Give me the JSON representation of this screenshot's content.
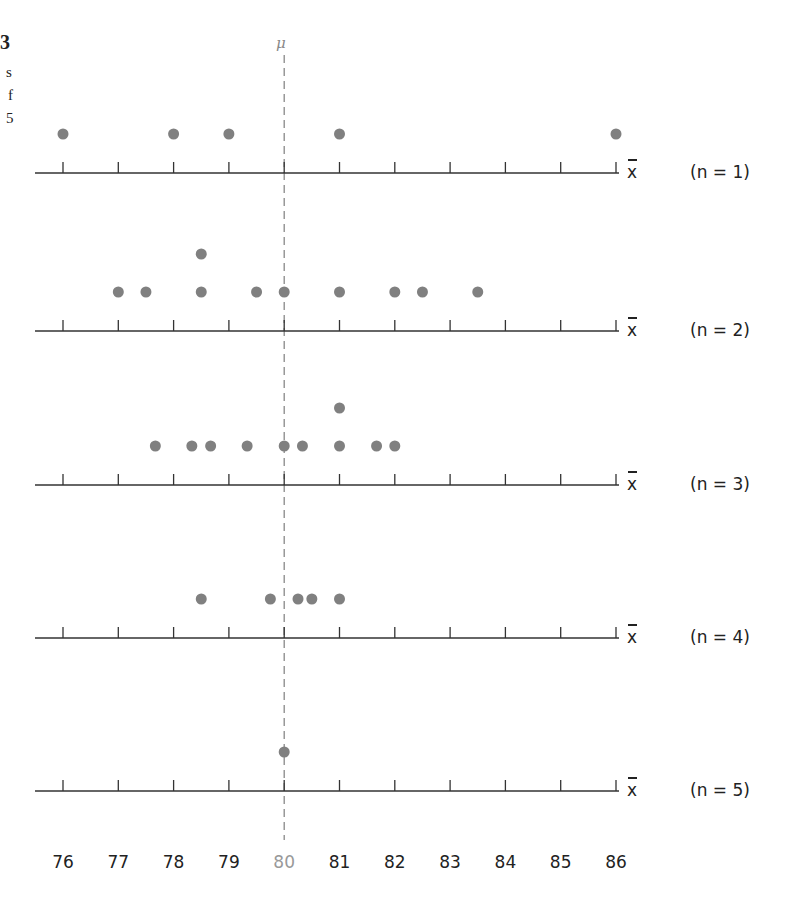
{
  "figure_fragment": {
    "left_text": [
      "3",
      "s",
      "f",
      "5"
    ]
  },
  "chart_data": {
    "type": "scatter",
    "subtype": "dot-plot",
    "title": "",
    "xlabel": "x̄",
    "ylabel": "",
    "xlim": [
      76,
      86
    ],
    "xticks": [
      76,
      77,
      78,
      79,
      80,
      81,
      82,
      83,
      84,
      85,
      86
    ],
    "highlight_tick": {
      "value": 80,
      "color": "#999999"
    },
    "reference_line": {
      "label": "μ",
      "value": 80,
      "style": "dashed",
      "color": "#888888"
    },
    "grid": false,
    "dot_color": "#808080",
    "series": [
      {
        "name": "x̄ (n = 1)",
        "axis_label": "x̄",
        "n_label": "(n = 1)",
        "values": [
          76,
          78,
          79,
          81,
          86
        ]
      },
      {
        "name": "x̄ (n = 2)",
        "axis_label": "x̄",
        "n_label": "(n = 2)",
        "values": [
          77,
          77.5,
          78.5,
          78.5,
          79.5,
          80,
          81,
          82,
          82.5,
          83.5
        ]
      },
      {
        "name": "x̄ (n = 3)",
        "axis_label": "x̄",
        "n_label": "(n = 3)",
        "values": [
          77.67,
          78.33,
          78.67,
          79.33,
          80,
          80.33,
          81,
          81,
          81.67,
          82
        ]
      },
      {
        "name": "x̄ (n = 4)",
        "axis_label": "x̄",
        "n_label": "(n = 4)",
        "values": [
          78.5,
          79.75,
          80.25,
          80.5,
          81
        ]
      },
      {
        "name": "x̄ (n = 5)",
        "axis_label": "x̄",
        "n_label": "(n = 5)",
        "values": [
          80
        ]
      }
    ]
  }
}
